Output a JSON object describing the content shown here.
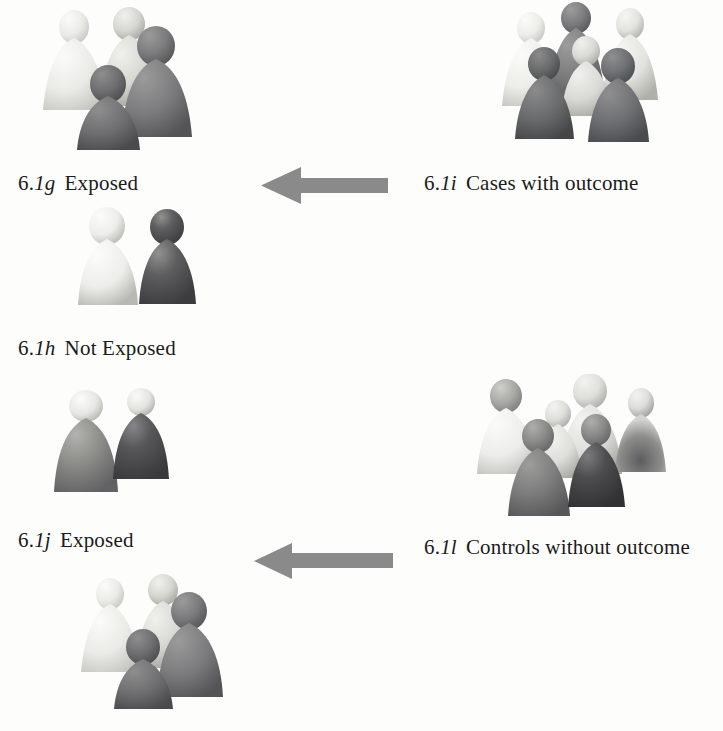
{
  "figure": {
    "background_color": "#fdfdfc",
    "arrow_color": "#8a8a8a"
  },
  "labels": [
    {
      "id": "g",
      "number_prefix": "6.",
      "number_italic": "1g",
      "text": "Exposed"
    },
    {
      "id": "h",
      "number_prefix": "6.",
      "number_italic": "1h",
      "text": "Not Exposed"
    },
    {
      "id": "i",
      "number_prefix": "6.",
      "number_italic": "1i",
      "text": "Cases with outcome"
    },
    {
      "id": "j",
      "number_prefix": "6.",
      "number_italic": "1j",
      "text": "Exposed"
    },
    {
      "id": "l",
      "number_prefix": "6.",
      "number_italic": "1l",
      "text": "Controls without outcome"
    }
  ],
  "arrows": [
    {
      "id": "arrow-cases",
      "direction": "left",
      "color": "#8a8a8a"
    },
    {
      "id": "arrow-controls",
      "direction": "left",
      "color": "#8a8a8a"
    }
  ],
  "groups": [
    {
      "id": "exposed-cases-cluster",
      "count": 4,
      "description": "cluster of four pawn figures above label 6.1g Exposed"
    },
    {
      "id": "cases-with-outcome-cluster",
      "count": 6,
      "description": "cluster of six pawn figures above label 6.1i Cases with outcome"
    },
    {
      "id": "not-exposed-cases-pair",
      "count": 2,
      "description": "pair of pawn figures above label 6.1h Not Exposed"
    },
    {
      "id": "exposed-controls-pair",
      "count": 2,
      "description": "pair of pawn figures above label 6.1j Exposed"
    },
    {
      "id": "controls-without-outcome-cluster",
      "count": 6,
      "description": "cluster of six pawn figures above label 6.1l Controls without outcome"
    },
    {
      "id": "not-exposed-controls-cluster",
      "count": 4,
      "description": "cluster of four pawn figures below label 6.1j Exposed"
    }
  ],
  "palette": {
    "very_light": "#ededea",
    "light": "#d8d8d4",
    "medium_light": "#b9b9b5",
    "medium": "#9a9a96",
    "medium_dark": "#77777a",
    "dark": "#5a5a5d",
    "very_dark": "#3e3e41"
  }
}
